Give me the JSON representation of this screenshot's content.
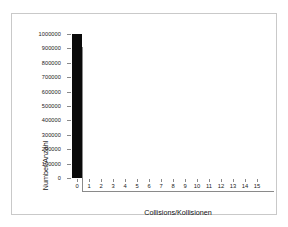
{
  "chart_data": {
    "type": "bar",
    "title": "",
    "xlabel": "Collisions/Kollisionen",
    "ylabel": "Number/Anzahl",
    "categories": [
      "0",
      "1",
      "2",
      "3",
      "4",
      "5",
      "6",
      "7",
      "8",
      "9",
      "10",
      "11",
      "12",
      "13",
      "14",
      "15"
    ],
    "values": [
      1000000,
      0,
      0,
      0,
      0,
      0,
      0,
      0,
      0,
      0,
      0,
      0,
      0,
      0,
      0,
      0
    ],
    "xlim": [
      -0.5,
      15.5
    ],
    "ylim": [
      0,
      1000000
    ],
    "ytick_labels": [
      "0",
      "100000",
      "200000",
      "300000",
      "400000",
      "500000",
      "600000",
      "700000",
      "800000",
      "900000",
      "1000000"
    ],
    "ytick_values": [
      0,
      100000,
      200000,
      300000,
      400000,
      500000,
      600000,
      700000,
      800000,
      900000,
      1000000
    ],
    "grid": false,
    "legend": null,
    "bar_color": "#0a0a0a",
    "axis_color": "#8a8a8a",
    "frame_color": "#c9c9c9",
    "background_color": "#ffffff"
  }
}
